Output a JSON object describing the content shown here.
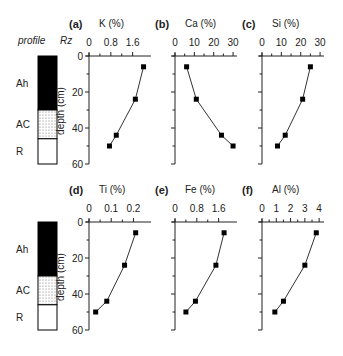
{
  "figure": {
    "profile_label": "profile",
    "rz_label": "Rz",
    "depth_label": "depth (cm)"
  },
  "chart_data": [
    {
      "type": "line",
      "panel": "(a)",
      "title": "K (%)",
      "xlabel": "K (%)",
      "ylabel": "depth (cm)",
      "xticks": [
        0,
        0.8,
        1.6
      ],
      "xtick_labels": [
        "0",
        "0.8",
        "1.6"
      ],
      "xlim": [
        0,
        2.2
      ],
      "yticks": [
        0,
        20,
        40,
        60
      ],
      "ylim": [
        0,
        60
      ],
      "y_inverted": true,
      "grid": false,
      "x": [
        2.0,
        1.7,
        1.0,
        0.75
      ],
      "depth": [
        6,
        24,
        44,
        50
      ]
    },
    {
      "type": "line",
      "panel": "(b)",
      "title": "Ca (%)",
      "xlabel": "Ca (%)",
      "ylabel": "",
      "xticks": [
        0,
        10,
        20,
        30
      ],
      "xtick_labels": [
        "0",
        "10",
        "20",
        "30"
      ],
      "xlim": [
        0,
        31
      ],
      "yticks": [
        0,
        20,
        40,
        60
      ],
      "ylim": [
        0,
        60
      ],
      "y_inverted": true,
      "grid": false,
      "x": [
        6,
        11,
        24,
        30
      ],
      "depth": [
        6,
        24,
        44,
        50
      ]
    },
    {
      "type": "line",
      "panel": "(c)",
      "title": "Si (%)",
      "xlabel": "Si (%)",
      "ylabel": "",
      "xticks": [
        0,
        10,
        20,
        30
      ],
      "xtick_labels": [
        "0",
        "10",
        "20",
        "30"
      ],
      "xlim": [
        0,
        31
      ],
      "yticks": [
        0,
        20,
        40,
        60
      ],
      "ylim": [
        0,
        60
      ],
      "y_inverted": true,
      "grid": false,
      "x": [
        25,
        21,
        12,
        8
      ],
      "depth": [
        6,
        24,
        44,
        50
      ]
    },
    {
      "type": "line",
      "panel": "(d)",
      "title": "Ti (%)",
      "xlabel": "Ti (%)",
      "ylabel": "depth (cm)",
      "xticks": [
        0,
        0.1,
        0.2
      ],
      "xtick_labels": [
        "0",
        "0.1",
        "0.2"
      ],
      "xlim": [
        0,
        0.27
      ],
      "yticks": [
        0,
        20,
        40,
        60
      ],
      "ylim": [
        0,
        60
      ],
      "y_inverted": true,
      "grid": false,
      "x": [
        0.21,
        0.16,
        0.08,
        0.03
      ],
      "depth": [
        6,
        24,
        44,
        50
      ]
    },
    {
      "type": "line",
      "panel": "(e)",
      "title": "Fe (%)",
      "xlabel": "Fe (%)",
      "ylabel": "",
      "xticks": [
        0,
        0.8,
        1.6
      ],
      "xtick_labels": [
        "0",
        "0.8",
        "1.6"
      ],
      "xlim": [
        0,
        2.2
      ],
      "yticks": [
        0,
        20,
        40,
        60
      ],
      "ylim": [
        0,
        60
      ],
      "y_inverted": true,
      "grid": false,
      "x": [
        1.8,
        1.5,
        0.75,
        0.4
      ],
      "depth": [
        6,
        24,
        44,
        50
      ]
    },
    {
      "type": "line",
      "panel": "(f)",
      "title": "Al (%)",
      "xlabel": "Al (%)",
      "ylabel": "",
      "xticks": [
        0,
        1,
        2,
        3,
        4
      ],
      "xtick_labels": [
        "0",
        "1",
        "2",
        "3",
        "4"
      ],
      "xlim": [
        0,
        4.2
      ],
      "yticks": [
        0,
        20,
        40,
        60
      ],
      "ylim": [
        0,
        60
      ],
      "y_inverted": true,
      "grid": false,
      "x": [
        3.8,
        3.0,
        1.5,
        0.9
      ],
      "depth": [
        6,
        24,
        44,
        50
      ]
    }
  ],
  "profile": {
    "horizons": [
      {
        "name": "Ah",
        "top": 0,
        "bottom": 30,
        "fill": "black"
      },
      {
        "name": "AC",
        "top": 30,
        "bottom": 46,
        "fill": "dotted"
      },
      {
        "name": "R",
        "top": 46,
        "bottom": 60,
        "fill": "white"
      }
    ]
  }
}
